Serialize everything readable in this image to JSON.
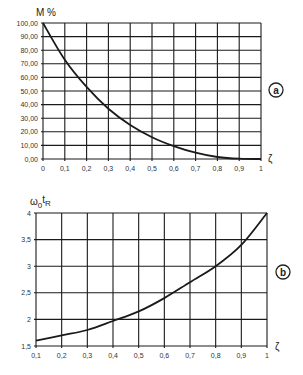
{
  "chart_data": [
    {
      "id": "a",
      "type": "line",
      "panel_label": "a",
      "title": "",
      "ylabel": "M %",
      "xlabel": "ζ",
      "xlim": [
        0,
        1
      ],
      "ylim": [
        0,
        100
      ],
      "grid": true,
      "x_ticks": [
        "0",
        "0,1",
        "0,2",
        "0,3",
        "0,4",
        "0,5",
        "0,6",
        "0,7",
        "0,8",
        "0,9",
        "1"
      ],
      "y_ticks": [
        "0,00",
        "10,00",
        "20,00",
        "30,00",
        "40,00",
        "50,00",
        "60,00",
        "70,00",
        "80,00",
        "90,00",
        "100,00"
      ],
      "x": [
        0,
        0.1,
        0.2,
        0.3,
        0.4,
        0.5,
        0.6,
        0.7,
        0.8,
        0.9,
        1.0
      ],
      "series": [
        {
          "name": "M %",
          "values": [
            100,
            73,
            53,
            37,
            25,
            16,
            9.5,
            4.6,
            1.5,
            0.2,
            0
          ]
        }
      ]
    },
    {
      "id": "b",
      "type": "line",
      "panel_label": "b",
      "title": "",
      "ylabel": "ω0tR",
      "ylabel_parts": {
        "main": "ω",
        "sub0": "0",
        "main2": "t",
        "sub1": "R"
      },
      "xlabel": "ζ",
      "xlim": [
        0.1,
        1
      ],
      "ylim": [
        1.5,
        4
      ],
      "grid": true,
      "x_ticks": [
        "0,1",
        "0,2",
        "0,3",
        "0,4",
        "0,5",
        "0,6",
        "0,7",
        "0,8",
        "0,9",
        "1"
      ],
      "y_ticks": [
        "1,5",
        "2",
        "2,5",
        "3",
        "3,5",
        "4"
      ],
      "x": [
        0.1,
        0.2,
        0.3,
        0.4,
        0.5,
        0.6,
        0.7,
        0.8,
        0.9,
        1.0
      ],
      "series": [
        {
          "name": "ω0tR",
          "values": [
            1.6,
            1.7,
            1.8,
            1.97,
            2.15,
            2.4,
            2.7,
            3.0,
            3.4,
            4.0
          ]
        }
      ]
    }
  ]
}
